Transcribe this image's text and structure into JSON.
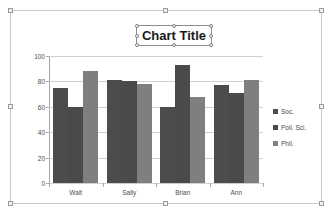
{
  "chart_object": {
    "selected": true,
    "title_selected": true
  },
  "chart_data": {
    "type": "bar",
    "title": "Chart Title",
    "xlabel": "",
    "ylabel": "",
    "categories": [
      "Walt",
      "Sally",
      "Brian",
      "Ann"
    ],
    "series": [
      {
        "name": "Soc.",
        "color": "#4c4c4c",
        "values": [
          75,
          81,
          60,
          77
        ]
      },
      {
        "name": "Poli. Sci.",
        "color": "#4a4a4a",
        "values": [
          60,
          80,
          93,
          71
        ]
      },
      {
        "name": "Phil.",
        "color": "#7f7f7f",
        "values": [
          88,
          78,
          68,
          81
        ]
      }
    ],
    "ylim": [
      0,
      100
    ],
    "yticks": [
      0,
      20,
      40,
      60,
      80,
      100
    ],
    "ytick_labels": [
      "0",
      "20",
      "40",
      "60",
      "80",
      "100"
    ],
    "grid": true,
    "grid_axis": "y",
    "legend_position": "right"
  }
}
